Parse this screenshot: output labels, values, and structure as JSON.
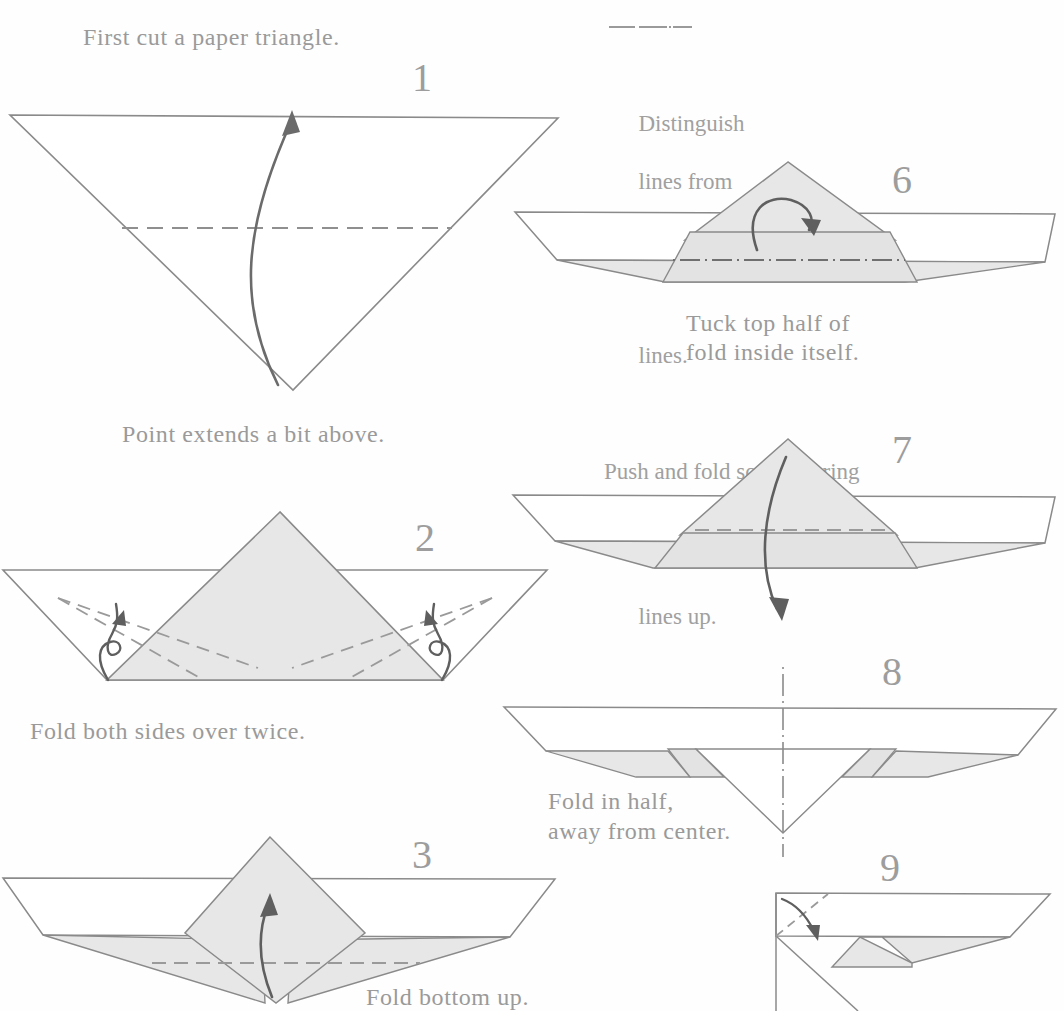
{
  "page": {
    "width": 1064,
    "height": 1011,
    "background": "#fefefe"
  },
  "colors": {
    "line": "#8a8a8a",
    "line_dark": "#6f6f6f",
    "shade": "#e7e7e7",
    "shade_dark": "#dedede",
    "text": "#9a9a9a",
    "arrow": "#6b6b6b",
    "paper_white": "#ffffff"
  },
  "captions": {
    "first_cut": "First cut a paper triangle.",
    "point_extends": "Point extends a bit above.",
    "fold_both_sides": "Fold both sides over twice.",
    "fold_bottom_up": "Fold bottom up.",
    "tuck_top_line1": "Tuck top half of",
    "tuck_top_line2": "fold inside itself.",
    "fold_in_half_line1": "Fold in half,",
    "fold_in_half_line2": "away from center."
  },
  "legend": {
    "line1_a": "Distinguish",
    "line1_b": "lines from",
    "line2_b": "lines.",
    "line3": "Push and fold so as to bring",
    "line4_b": "lines up.",
    "dashdot_symbol": "-·-·-",
    "dashed_symbol": "- - - -"
  },
  "steps": [
    {
      "id": 1,
      "label": "1",
      "name": "step-1-cut-triangle"
    },
    {
      "id": 2,
      "label": "2",
      "name": "step-2-fold-sides"
    },
    {
      "id": 3,
      "label": "3",
      "name": "step-3-fold-bottom-up"
    },
    {
      "id": 6,
      "label": "6",
      "name": "step-6-tuck-top-half"
    },
    {
      "id": 7,
      "label": "7",
      "name": "step-7-fold-down"
    },
    {
      "id": 8,
      "label": "8",
      "name": "step-8-fold-in-half"
    },
    {
      "id": 9,
      "label": "9",
      "name": "step-9-corner-fold"
    }
  ],
  "figures": {
    "fig1": {
      "name": "inverted-triangle-with-crease",
      "description": "Large inverted paper triangle with horizontal dashed crease and upward curved arrow",
      "vertices": [
        [
          10,
          115
        ],
        [
          558,
          118
        ],
        [
          293,
          390
        ]
      ],
      "crease_y": 228,
      "crease_x1": 122,
      "crease_x2": 450
    },
    "fig2": {
      "name": "boat-with-center-triangle-and-side-folds",
      "description": "Trapezoid boat with shaded center triangle, dashed fold lines and two curved side arrows"
    },
    "fig3": {
      "name": "boat-with-diamond-and-up-arrow",
      "description": "Boat shape with shaded diamond and upward arrow, horizontal dashed crease"
    },
    "fig6": {
      "name": "boat-with-triangle-and-rotate-arrow",
      "description": "Boat with shaded triangle, circular tuck arrow and dash-dot crease line"
    },
    "fig7": {
      "name": "boat-with-triangle-and-down-arrow",
      "description": "Boat with shaded triangle, dashed crease and long downward curved arrow"
    },
    "fig8": {
      "name": "flat-boat-with-vertical-centerline",
      "description": "Flattened boat with vertical dash-dot center fold line"
    },
    "fig9": {
      "name": "side-profile-with-corner-fold",
      "description": "Side profile of folded boat with dashed diagonal corner fold and short arrow"
    }
  }
}
